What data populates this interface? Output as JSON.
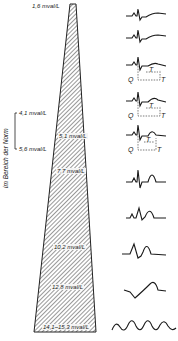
{
  "figure": {
    "vertical_label": "im Bereich der Norm",
    "top_label": "1,6 mval/L",
    "bracket_labels": [
      "4,1 mval/L",
      "5,6 mval/L"
    ],
    "wedge_labels": [
      "5,1 mval/L",
      "7,7 mval/L",
      "10,2 mval/L",
      "12,8 mval/L",
      "14,1–15,3 mval/L"
    ],
    "ecg_annotations": {
      "q": "Q",
      "t": "T"
    }
  }
}
